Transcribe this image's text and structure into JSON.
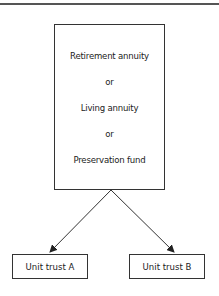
{
  "diagram": {
    "source_box": {
      "lines": [
        "Retirement annuity",
        "or",
        "Living annuity",
        "or",
        "Preservation fund"
      ]
    },
    "targets": [
      {
        "label": "Unit trust A"
      },
      {
        "label": "Unit trust B"
      }
    ],
    "edges": [
      {
        "from": "source_box",
        "to": "Unit trust A"
      },
      {
        "from": "source_box",
        "to": "Unit trust B"
      }
    ],
    "colors": {
      "stroke": "#333333",
      "background": "#ffffff"
    }
  }
}
